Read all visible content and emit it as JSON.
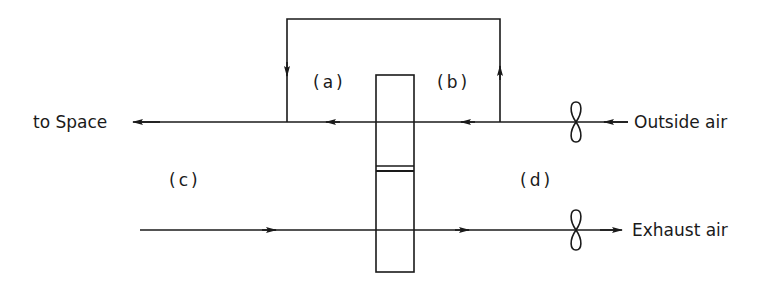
{
  "diagram": {
    "type": "heat recovery wheel airflow schematic",
    "labels": {
      "to_space": "to Space",
      "outside_air": "Outside air",
      "exhaust_air": "Exhaust air",
      "region_a": "(a)",
      "region_b": "(b)",
      "region_c": "(c)",
      "region_d": "(d)"
    },
    "components": {
      "wheel": "rotary heat exchanger (vertical rectangle with divider)",
      "supply_fan": "fan on outside air line",
      "exhaust_fan": "fan on exhaust air line",
      "bypass_duct": "bypass loop from (b) side to (a) side over the wheel"
    },
    "flows": [
      {
        "name": "supply",
        "from": "Outside air",
        "to": "to Space",
        "direction": "right-to-left"
      },
      {
        "name": "exhaust",
        "from": "space side",
        "to": "Exhaust air",
        "direction": "left-to-right"
      },
      {
        "name": "bypass",
        "from": "(b) side",
        "to": "(a) side",
        "direction": "up, over, down"
      }
    ],
    "line_color": "#1a1a1a"
  }
}
